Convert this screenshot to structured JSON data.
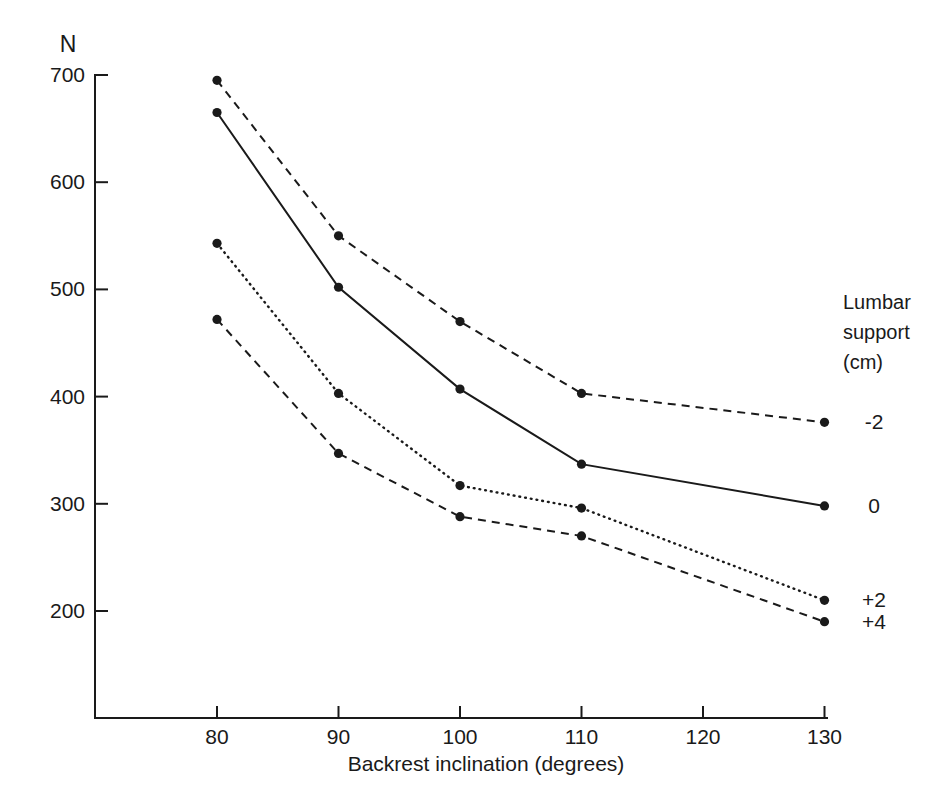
{
  "chart_data": {
    "type": "line",
    "title": "",
    "xlabel": "Backrest inclination (degrees)",
    "ylabel": "N",
    "x_ticks": [
      80,
      90,
      100,
      110,
      120,
      130
    ],
    "y_ticks": [
      200,
      300,
      400,
      500,
      600,
      700
    ],
    "xlim": [
      70,
      130.5
    ],
    "ylim": [
      100,
      700
    ],
    "grid": false,
    "x": [
      80,
      90,
      100,
      110,
      130
    ],
    "series": [
      {
        "name": "-2",
        "style": "dashed",
        "values": [
          695,
          550,
          470,
          403,
          376
        ]
      },
      {
        "name": "0",
        "style": "solid",
        "values": [
          665,
          502,
          407,
          337,
          298
        ]
      },
      {
        "name": "+2",
        "style": "dotted",
        "values": [
          543,
          403,
          317,
          296,
          210
        ]
      },
      {
        "name": "+4",
        "style": "dashed",
        "values": [
          472,
          347,
          288,
          270,
          190
        ]
      }
    ],
    "legend": {
      "position": "right",
      "title_lines": [
        "Lumbar",
        "support",
        "(cm)"
      ]
    },
    "colors": {
      "line": "#1a1a1a",
      "text": "#1a1a1a",
      "background": "#ffffff"
    },
    "marker": "filled-circle"
  }
}
